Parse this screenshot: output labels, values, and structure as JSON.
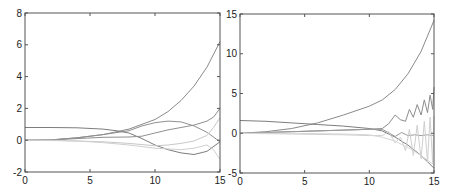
{
  "chart_data": [
    {
      "type": "line",
      "title": "",
      "xlabel": "",
      "ylabel": "",
      "xlim": [
        0,
        15
      ],
      "ylim": [
        -2,
        8
      ],
      "xticks": [
        0,
        5,
        10,
        15
      ],
      "yticks": [
        -2,
        0,
        2,
        4,
        6,
        8
      ],
      "grid": false,
      "legend": null,
      "box": {
        "left": 25,
        "top": 13,
        "right": 220,
        "bottom": 172
      },
      "series": [
        {
          "name": "curve-1",
          "color": "#8a8a8a",
          "x": [
            0,
            2,
            4,
            6,
            8,
            10,
            11,
            12,
            13,
            14,
            15
          ],
          "y": [
            0,
            0.02,
            0.15,
            0.35,
            0.7,
            1.3,
            1.8,
            2.5,
            3.4,
            4.6,
            6.2
          ]
        },
        {
          "name": "curve-2",
          "color": "#7d7d7d",
          "x": [
            0,
            2,
            4,
            6,
            7,
            8,
            9,
            10,
            11,
            12,
            13,
            14,
            15
          ],
          "y": [
            0.8,
            0.8,
            0.78,
            0.7,
            0.6,
            0.45,
            0.1,
            -0.3,
            -0.6,
            -0.8,
            -0.9,
            -0.7,
            -0.1
          ]
        },
        {
          "name": "curve-3",
          "color": "#909090",
          "x": [
            0,
            2,
            4,
            6,
            8,
            9,
            10,
            11,
            12,
            13,
            14,
            15
          ],
          "y": [
            0,
            0.02,
            0.15,
            0.35,
            0.6,
            0.9,
            1.1,
            1.2,
            1.15,
            0.9,
            0.5,
            -0.1
          ]
        },
        {
          "name": "curve-4",
          "color": "#8f8f8f",
          "x": [
            0,
            2,
            4,
            6,
            8,
            9,
            10,
            11,
            12,
            13,
            14,
            14.5,
            15
          ],
          "y": [
            0,
            0.02,
            0.1,
            0.18,
            0.2,
            0.25,
            0.45,
            0.65,
            0.8,
            0.95,
            1.2,
            1.45,
            2.0
          ]
        },
        {
          "name": "curve-5",
          "color": "#c8c8c8",
          "x": [
            0,
            2,
            4,
            6,
            8,
            10,
            11,
            12,
            13,
            14,
            14.5,
            15
          ],
          "y": [
            0,
            -0.02,
            -0.05,
            -0.1,
            -0.2,
            -0.35,
            -0.3,
            -0.2,
            -0.05,
            0.3,
            0.8,
            1.4
          ]
        },
        {
          "name": "curve-6",
          "color": "#d0d0d0",
          "x": [
            0,
            2,
            4,
            6,
            8,
            10,
            12,
            13,
            14,
            14.5,
            15
          ],
          "y": [
            0,
            0,
            -0.05,
            -0.15,
            -0.3,
            -0.5,
            -0.6,
            -0.5,
            -0.3,
            -0.6,
            -1.2
          ]
        }
      ]
    },
    {
      "type": "line",
      "title": "",
      "xlabel": "",
      "ylabel": "",
      "xlim": [
        0,
        15
      ],
      "ylim": [
        -5,
        15
      ],
      "xticks": [
        0,
        5,
        10,
        15
      ],
      "yticks": [
        -5,
        0,
        5,
        10,
        15
      ],
      "grid": false,
      "legend": null,
      "box": {
        "left": 240,
        "top": 14,
        "right": 434,
        "bottom": 173
      },
      "series": [
        {
          "name": "curve-1",
          "color": "#8a8a8a",
          "x": [
            0,
            2,
            4,
            6,
            8,
            10,
            11,
            12,
            13,
            14,
            15
          ],
          "y": [
            0,
            0.2,
            0.6,
            1.3,
            2.3,
            3.4,
            4.2,
            5.5,
            7.5,
            10.3,
            14.2
          ]
        },
        {
          "name": "curve-2",
          "color": "#7d7d7d",
          "x": [
            0,
            2,
            4,
            6,
            8,
            10,
            11,
            12,
            13,
            14,
            15
          ],
          "y": [
            1.6,
            1.5,
            1.3,
            1.1,
            0.9,
            0.6,
            0.3,
            -0.5,
            -1.5,
            -2.8,
            -4.4
          ]
        },
        {
          "name": "curve-3-oscillating",
          "color": "#8c8c8c",
          "x": [
            0,
            4,
            8,
            10,
            11,
            11.5,
            12,
            12.4,
            12.8,
            13.1,
            13.4,
            13.7,
            14.0,
            14.25,
            14.5,
            14.7,
            14.9,
            15
          ],
          "y": [
            0,
            0.2,
            0.4,
            0.5,
            0.6,
            1.2,
            2.3,
            1.7,
            1.5,
            3.0,
            2.0,
            3.6,
            2.3,
            4.2,
            2.6,
            4.8,
            3.0,
            5.8
          ]
        },
        {
          "name": "curve-4",
          "color": "#9a9a9a",
          "x": [
            0,
            4,
            8,
            10,
            11,
            12,
            12.5,
            13,
            13.5,
            14,
            14.5,
            15
          ],
          "y": [
            0,
            0.2,
            0.4,
            0.5,
            0.5,
            -0.4,
            0.1,
            -0.3,
            -0.2,
            -0.3,
            -0.2,
            -0.3
          ]
        },
        {
          "name": "curve-5-oscillating",
          "color": "#cfcfcf",
          "x": [
            0,
            4,
            8,
            10,
            11,
            11.5,
            12,
            12.4,
            12.8,
            13.1,
            13.4,
            13.7,
            14.0,
            14.25,
            14.5,
            14.7,
            14.9,
            15
          ],
          "y": [
            0,
            -0.1,
            -0.2,
            -0.3,
            -0.3,
            0.2,
            -1.2,
            -0.5,
            -2.2,
            0.5,
            -2.8,
            1.0,
            -3.2,
            1.5,
            -3.6,
            2.0,
            -3.8,
            2.2
          ]
        },
        {
          "name": "curve-6",
          "color": "#d6d6d6",
          "x": [
            0,
            4,
            8,
            10,
            11,
            12,
            13,
            14,
            15
          ],
          "y": [
            0,
            0,
            -0.1,
            -0.2,
            -0.5,
            -1.0,
            -1.8,
            -2.8,
            -4.0
          ]
        }
      ]
    }
  ]
}
